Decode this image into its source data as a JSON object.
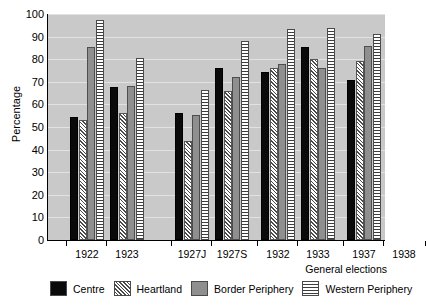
{
  "chart_data": {
    "type": "bar",
    "title": "",
    "xlabel": "General elections",
    "ylabel": "Percentage",
    "ylim": [
      0,
      100
    ],
    "ytick_step": 10,
    "yticks": [
      0,
      10,
      20,
      30,
      40,
      50,
      60,
      70,
      80,
      90,
      100
    ],
    "grid": true,
    "legend_position": "bottom",
    "categories": [
      "1922",
      "1923",
      "1927J",
      "1927S",
      "1932",
      "1933",
      "1937",
      "1938"
    ],
    "series": [
      {
        "name": "Centre",
        "pattern": "solid-black",
        "color": "#0a0a0a",
        "values": [
          54.5,
          67.5,
          56,
          76,
          74.5,
          85.5,
          71,
          83
        ]
      },
      {
        "name": "Heartland",
        "pattern": "diagonal-hatch",
        "color": "#f2f2f2",
        "values": [
          53,
          56,
          44,
          66,
          76,
          80,
          79,
          83
        ]
      },
      {
        "name": "Border Periphery",
        "pattern": "solid-gray",
        "color": "#8f8f8f",
        "values": [
          85.5,
          68,
          55.5,
          72,
          78,
          76,
          86,
          91
        ]
      },
      {
        "name": "Western  Periphery",
        "pattern": "horizontal-lines",
        "color": "#ffffff",
        "values": [
          97.5,
          80.5,
          66.5,
          88,
          93.5,
          94,
          91,
          92
        ]
      }
    ],
    "group_positions_px": [
      22,
      62,
      127,
      167,
      213,
      253,
      299,
      339
    ],
    "plot_bg": "#c9c9c9",
    "gridline_color": "#e2e2e2"
  },
  "axes": {
    "y_title": "Percentage",
    "x_title": "General elections"
  }
}
